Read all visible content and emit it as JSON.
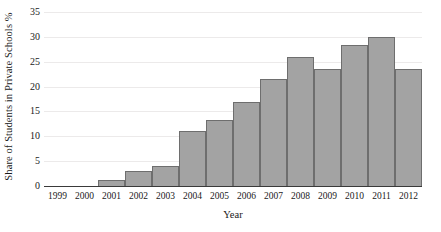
{
  "chart_data": {
    "type": "bar",
    "title": "",
    "xlabel": "Year",
    "ylabel": "Share of Students in Private Schools %",
    "categories": [
      "1999",
      "2000",
      "2001",
      "2002",
      "2003",
      "2004",
      "2005",
      "2006",
      "2007",
      "2008",
      "2009",
      "2010",
      "2011",
      "2012"
    ],
    "values": [
      0,
      0,
      1.2,
      3.0,
      4.1,
      11.0,
      13.3,
      16.8,
      21.6,
      26.0,
      23.5,
      28.3,
      29.9,
      23.6
    ],
    "ylim": [
      0,
      35
    ],
    "yticks": [
      "0",
      "5",
      "10",
      "15",
      "20",
      "25",
      "30",
      "35"
    ],
    "ytick_values": [
      0,
      5,
      10,
      15,
      20,
      25,
      30,
      35
    ],
    "grid": true,
    "legend": "none",
    "bar_fill_color": "#a3a3a3",
    "bar_edge_color": "#6e6e6e",
    "gridline_color": "#eceaea",
    "axis_color": "#3a3a3a"
  }
}
